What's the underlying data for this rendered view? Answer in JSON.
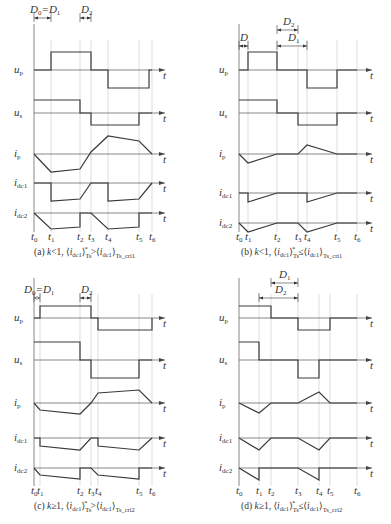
{
  "panels": [
    {
      "id": "a",
      "caption": "(a) k<1, ⟨i_dc1⟩*_Ts > ⟨i_dc1⟩_Ts_cri1",
      "caption_parts": {
        "prefix": "(a) ",
        "k": "k",
        "cond": "<1, ",
        "rel": ">",
        "sub_right": "Ts_cri1"
      },
      "origin_x": 34,
      "end_x": 165,
      "top_y": 0,
      "t": [
        34,
        51,
        80,
        91,
        108,
        139,
        152
      ],
      "t_labels": [
        "t0",
        "t1",
        "t2",
        "t3",
        "t4",
        "t5",
        "t6"
      ],
      "dims": [
        {
          "label": "D0=D1",
          "x1": 34,
          "x2": 51,
          "y": 18,
          "tx": 30
        },
        {
          "label": "D2",
          "x1": 80,
          "x2": 91,
          "y": 18,
          "tx": 81
        }
      ],
      "traces": {
        "up": {
          "base": 70,
          "pts": [
            [
              34,
              70
            ],
            [
              51,
              70
            ],
            [
              51,
              52
            ],
            [
              91,
              52
            ],
            [
              91,
              70
            ],
            [
              108,
              70
            ],
            [
              108,
              88
            ],
            [
              149,
              88
            ],
            [
              149,
              70
            ],
            [
              152,
              70
            ]
          ]
        },
        "us": {
          "base": 113,
          "pts": [
            [
              34,
              100
            ],
            [
              80,
              100
            ],
            [
              80,
              113
            ],
            [
              91,
              113
            ],
            [
              91,
              125
            ],
            [
              139,
              125
            ],
            [
              139,
              113
            ],
            [
              152,
              113
            ]
          ]
        },
        "ip": {
          "base": 154,
          "pts": [
            [
              34,
              154
            ],
            [
              51,
              172
            ],
            [
              80,
              169
            ],
            [
              91,
              152
            ],
            [
              108,
              136
            ],
            [
              139,
              141
            ],
            [
              152,
              154
            ]
          ]
        },
        "idc1": {
          "base": 183,
          "pts": [
            [
              34,
              183
            ],
            [
              51,
              183
            ],
            [
              51,
              201
            ],
            [
              80,
              199
            ],
            [
              91,
              183
            ],
            [
              108,
              183
            ],
            [
              108,
              201
            ],
            [
              139,
              199
            ],
            [
              152,
              183
            ]
          ]
        },
        "idc2": {
          "base": 213,
          "pts": [
            [
              34,
              213
            ],
            [
              51,
              229
            ],
            [
              80,
              227
            ],
            [
              80,
              213
            ],
            [
              91,
              213
            ],
            [
              108,
              229
            ],
            [
              139,
              227
            ],
            [
              139,
              213
            ],
            [
              152,
              213
            ]
          ]
        }
      },
      "label_y": 240
    },
    {
      "id": "b",
      "caption": "(b) k<1, ⟨i_dc1⟩*_Ts ≤ ⟨i_dc1⟩_Ts_cri1",
      "caption_parts": {
        "prefix": "(b) ",
        "k": "k",
        "cond": "<1, ",
        "rel": "≤",
        "sub_right": "Ts_cri1"
      },
      "origin_x": 239,
      "end_x": 372,
      "t": [
        239,
        248,
        277,
        298,
        307,
        337,
        357
      ],
      "t_labels": [
        "t0",
        "t1",
        "t2",
        "t3",
        "t4",
        "t5",
        "t6"
      ],
      "dims": [
        {
          "label": "D",
          "x1": 239,
          "x2": 248,
          "y": 46,
          "tx": 240
        },
        {
          "label": "D2",
          "x1": 277,
          "x2": 298,
          "y": 30,
          "tx": 283
        },
        {
          "label": "D1",
          "x1": 277,
          "x2": 307,
          "y": 46,
          "tx": 288
        }
      ],
      "traces": {
        "up": {
          "base": 70,
          "pts": [
            [
              239,
              70
            ],
            [
              248,
              70
            ],
            [
              248,
              52
            ],
            [
              277,
              52
            ],
            [
              277,
              70
            ],
            [
              307,
              70
            ],
            [
              307,
              88
            ],
            [
              337,
              88
            ],
            [
              337,
              70
            ],
            [
              357,
              70
            ]
          ]
        },
        "us": {
          "base": 113,
          "pts": [
            [
              239,
              100
            ],
            [
              277,
              100
            ],
            [
              277,
              113
            ],
            [
              298,
              113
            ],
            [
              298,
              125
            ],
            [
              337,
              125
            ],
            [
              337,
              113
            ],
            [
              357,
              113
            ]
          ]
        },
        "ip": {
          "base": 154,
          "pts": [
            [
              239,
              154
            ],
            [
              248,
              163
            ],
            [
              277,
              154
            ],
            [
              298,
              154
            ],
            [
              307,
              145
            ],
            [
              337,
              154
            ],
            [
              357,
              154
            ]
          ]
        },
        "idc1": {
          "base": 193,
          "pts": [
            [
              239,
              193
            ],
            [
              248,
              193
            ],
            [
              248,
              202
            ],
            [
              277,
              193
            ],
            [
              307,
              193
            ],
            [
              307,
              202
            ],
            [
              337,
              193
            ],
            [
              357,
              193
            ]
          ]
        },
        "idc2": {
          "base": 223,
          "pts": [
            [
              239,
              223
            ],
            [
              248,
              232
            ],
            [
              277,
              223
            ],
            [
              298,
              223
            ],
            [
              307,
              232
            ],
            [
              337,
              223
            ],
            [
              357,
              223
            ]
          ]
        }
      },
      "label_y": 240
    },
    {
      "id": "c",
      "caption": "(c) k≥1, ⟨i_dc1⟩*_Ts > ⟨i_dc1⟩_Ts_cri2",
      "caption_parts": {
        "prefix": "(c) ",
        "k": "k",
        "cond": "≥1, ",
        "rel": ">",
        "sub_right": "Ts_cri2"
      },
      "origin_x": 34,
      "end_x": 165,
      "t": [
        34,
        40,
        80,
        91,
        98,
        139,
        152
      ],
      "t_labels": [
        "t0",
        "t1",
        "t2",
        "t3",
        "t4",
        "t5",
        "t6"
      ],
      "dims": [
        {
          "label": "D0=D1",
          "x1": 34,
          "x2": 40,
          "y": 298,
          "tx": 24
        },
        {
          "label": "D2",
          "x1": 80,
          "x2": 91,
          "y": 298,
          "tx": 81
        }
      ],
      "traces": {
        "up": {
          "base": 318,
          "pts": [
            [
              34,
              318
            ],
            [
              40,
              318
            ],
            [
              40,
              306
            ],
            [
              91,
              306
            ],
            [
              91,
              318
            ],
            [
              98,
              318
            ],
            [
              98,
              330
            ],
            [
              152,
              330
            ],
            [
              152,
              318
            ]
          ]
        },
        "us": {
          "base": 360,
          "pts": [
            [
              34,
              342
            ],
            [
              80,
              342
            ],
            [
              80,
              360
            ],
            [
              91,
              360
            ],
            [
              91,
              378
            ],
            [
              139,
              378
            ],
            [
              139,
              360
            ],
            [
              152,
              360
            ]
          ]
        },
        "ip": {
          "base": 403,
          "pts": [
            [
              34,
              403
            ],
            [
              40,
              410
            ],
            [
              80,
              414
            ],
            [
              91,
              403
            ],
            [
              98,
              393
            ],
            [
              139,
              390
            ],
            [
              152,
              403
            ]
          ]
        },
        "idc1": {
          "base": 438,
          "pts": [
            [
              34,
              438
            ],
            [
              40,
              438
            ],
            [
              40,
              446
            ],
            [
              80,
              450
            ],
            [
              91,
              438
            ],
            [
              98,
              438
            ],
            [
              98,
              446
            ],
            [
              139,
              450
            ],
            [
              152,
              438
            ]
          ]
        },
        "idc2": {
          "base": 468,
          "pts": [
            [
              34,
              468
            ],
            [
              40,
              475
            ],
            [
              80,
              479
            ],
            [
              80,
              468
            ],
            [
              91,
              468
            ],
            [
              98,
              475
            ],
            [
              139,
              479
            ],
            [
              139,
              468
            ],
            [
              152,
              468
            ]
          ]
        }
      },
      "label_y": 494
    },
    {
      "id": "d",
      "caption": "(d) k≥1, ⟨i_dc1⟩*_Ts ≤ ⟨i_dc1⟩_Ts_cri2",
      "caption_parts": {
        "prefix": "(d) ",
        "k": "k",
        "cond": "≥1, ",
        "rel": "≤",
        "sub_right": "Ts_cri2"
      },
      "origin_x": 239,
      "end_x": 372,
      "t": [
        239,
        259,
        271,
        298,
        319,
        330,
        357
      ],
      "t_labels": [
        "t0",
        "t1",
        "t2",
        "t3",
        "t4",
        "t5",
        "t6"
      ],
      "dims": [
        {
          "label": "D1",
          "x1": 271,
          "x2": 298,
          "y": 283,
          "tx": 279
        },
        {
          "label": "D2",
          "x1": 259,
          "x2": 298,
          "y": 298,
          "tx": 275
        }
      ],
      "traces": {
        "up": {
          "base": 318,
          "pts": [
            [
              239,
              306
            ],
            [
              271,
              306
            ],
            [
              271,
              318
            ],
            [
              298,
              318
            ],
            [
              298,
              330
            ],
            [
              330,
              330
            ],
            [
              330,
              318
            ],
            [
              357,
              318
            ]
          ]
        },
        "us": {
          "base": 360,
          "pts": [
            [
              239,
              342
            ],
            [
              259,
              342
            ],
            [
              259,
              360
            ],
            [
              298,
              360
            ],
            [
              298,
              378
            ],
            [
              319,
              378
            ],
            [
              319,
              360
            ],
            [
              357,
              360
            ]
          ]
        },
        "ip": {
          "base": 403,
          "pts": [
            [
              239,
              403
            ],
            [
              259,
              413
            ],
            [
              271,
              403
            ],
            [
              298,
              403
            ],
            [
              319,
              392
            ],
            [
              330,
              403
            ],
            [
              357,
              403
            ]
          ]
        },
        "idc1": {
          "base": 438,
          "pts": [
            [
              239,
              438
            ],
            [
              259,
              450
            ],
            [
              271,
              438
            ],
            [
              298,
              438
            ],
            [
              319,
              450
            ],
            [
              330,
              438
            ],
            [
              357,
              438
            ]
          ]
        },
        "idc2": {
          "base": 468,
          "pts": [
            [
              239,
              468
            ],
            [
              259,
              480
            ],
            [
              259,
              468
            ],
            [
              298,
              468
            ],
            [
              319,
              480
            ],
            [
              319,
              468
            ],
            [
              357,
              468
            ]
          ]
        }
      },
      "label_y": 494
    }
  ],
  "signal_labels": {
    "up": "u",
    "up_sub": "p",
    "us": "u",
    "us_sub": "s",
    "ip": "i",
    "ip_sub": "p",
    "idc1": "i",
    "idc1_sub": "dc1",
    "idc2": "i",
    "idc2_sub": "dc2"
  },
  "axis_label": "t",
  "colors": {
    "wave": "#3a3a3a",
    "grid": "#c8c8c8",
    "axis": "#6a6a6a",
    "text": "#333333"
  }
}
